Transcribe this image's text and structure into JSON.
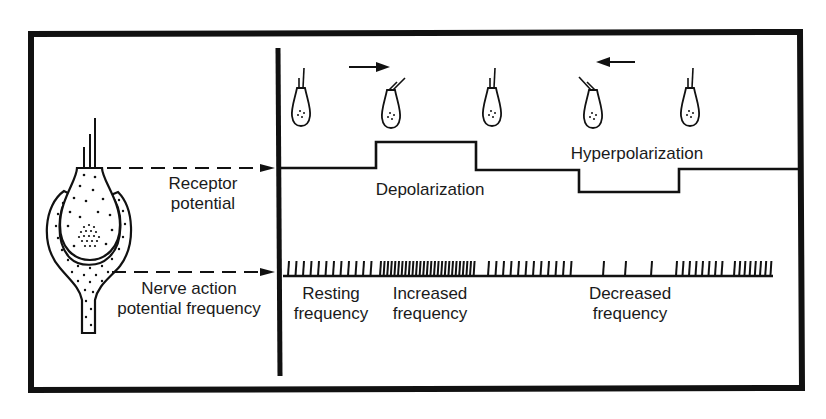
{
  "diagram": {
    "title": "",
    "left_panel": {
      "receptor_label": [
        "Receptor",
        "potential"
      ],
      "nerve_label": [
        "Nerve action",
        "potential frequency"
      ]
    },
    "right_panel": {
      "hair_cells": [
        {
          "position": "rest",
          "deflection": "none"
        },
        {
          "position": "deflected",
          "deflection": "right",
          "arrow": "right"
        },
        {
          "position": "rest",
          "deflection": "none"
        },
        {
          "position": "deflected",
          "deflection": "left",
          "arrow": "left"
        },
        {
          "position": "rest",
          "deflection": "none"
        }
      ],
      "receptor_trace_labels": {
        "depolarization": "Depolarization",
        "hyperpolarization": "Hyperpolarization"
      },
      "spike_train_labels": {
        "resting": [
          "Resting",
          "frequency"
        ],
        "increased": [
          "Increased",
          "frequency"
        ],
        "decreased": [
          "Decreased",
          "frequency"
        ]
      }
    },
    "colors": {
      "ink": "#111111",
      "background": "#ffffff"
    }
  }
}
